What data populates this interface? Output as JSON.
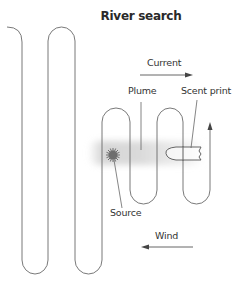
{
  "title": "River search",
  "labels": {
    "current": "Current",
    "plume": "Plume",
    "scent_print": "Scent print",
    "source": "Source",
    "wind": "Wind"
  },
  "colors": {
    "line": "#555555",
    "plume": "#cfcfcf",
    "source": "#777777",
    "text": "#333333"
  },
  "arrows": {
    "current_direction": "right",
    "wind_direction": "left",
    "path_direction": "up"
  }
}
